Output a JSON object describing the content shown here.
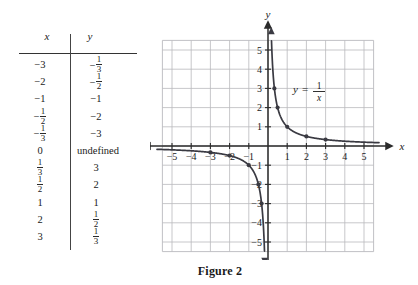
{
  "figure": {
    "caption": "Figure 2",
    "equation_label": "y = 1/x"
  },
  "table": {
    "name": "table-of-values",
    "headers": {
      "x": "x",
      "y": "y"
    },
    "rows": [
      {
        "x": "−3",
        "x_type": "plain",
        "y": "−1/3",
        "y_type": "neg-frac",
        "y_num": "1",
        "y_den": "3"
      },
      {
        "x": "−2",
        "x_type": "plain",
        "y": "−1/2",
        "y_type": "neg-frac",
        "y_num": "1",
        "y_den": "2"
      },
      {
        "x": "−1",
        "x_type": "plain",
        "y": "−1",
        "y_type": "plain"
      },
      {
        "x": "−1/2",
        "x_type": "neg-frac",
        "x_num": "1",
        "x_den": "2",
        "y": "−2",
        "y_type": "plain"
      },
      {
        "x": "−1/3",
        "x_type": "neg-frac",
        "x_num": "1",
        "x_den": "3",
        "y": "−3",
        "y_type": "plain"
      },
      {
        "x": "0",
        "x_type": "plain",
        "y": "undefined",
        "y_type": "wide"
      },
      {
        "x": "1/3",
        "x_type": "frac",
        "x_num": "1",
        "x_den": "3",
        "y": "3",
        "y_type": "plain"
      },
      {
        "x": "1/2",
        "x_type": "frac",
        "x_num": "1",
        "x_den": "2",
        "y": "2",
        "y_type": "plain"
      },
      {
        "x": "1",
        "x_type": "plain",
        "y": "1",
        "y_type": "plain"
      },
      {
        "x": "2",
        "x_type": "plain",
        "y": "1/2",
        "y_type": "frac",
        "y_num": "1",
        "y_den": "2"
      },
      {
        "x": "3",
        "x_type": "plain",
        "y": "1/3",
        "y_type": "frac",
        "y_num": "1",
        "y_den": "3"
      }
    ]
  },
  "chart_data": {
    "type": "line",
    "title": "",
    "equation": "y = 1/x",
    "equation_parts": {
      "lhs": "y",
      "eq": "=",
      "num": "1",
      "den": "x"
    },
    "xlabel": "x",
    "ylabel": "y",
    "xlim": [
      -5.8,
      5.8
    ],
    "ylim": [
      -5.8,
      5.8
    ],
    "grid": true,
    "grid_step": 1,
    "x_ticks": [
      "−5",
      "−4",
      "−3",
      "−2",
      "−1",
      "1",
      "2",
      "3",
      "4",
      "5"
    ],
    "x_tick_values": [
      -5,
      -4,
      -3,
      -2,
      -1,
      1,
      2,
      3,
      4,
      5
    ],
    "y_ticks": [
      "5",
      "4",
      "3",
      "2",
      "1",
      "−1",
      "−2",
      "−3",
      "−4",
      "−5"
    ],
    "y_tick_values": [
      5,
      4,
      3,
      2,
      1,
      -1,
      -2,
      -3,
      -4,
      -5
    ],
    "series": [
      {
        "name": "y = 1/x (negative branch)",
        "x": [
          -5.8,
          -5,
          -4,
          -3,
          -2,
          -1,
          -0.5,
          -0.3333,
          -0.2,
          -0.18
        ],
        "y": [
          -0.1724,
          -0.2,
          -0.25,
          -0.3333,
          -0.5,
          -1,
          -2,
          -3,
          -5,
          -5.55
        ]
      },
      {
        "name": "y = 1/x (positive branch)",
        "x": [
          0.18,
          0.2,
          0.3333,
          0.5,
          1,
          2,
          3,
          4,
          5,
          5.8
        ],
        "y": [
          5.55,
          5,
          3,
          2,
          1,
          0.5,
          0.3333,
          0.25,
          0.2,
          0.1724
        ]
      }
    ],
    "points": [
      {
        "x": -3,
        "y": -0.3333,
        "label": "(−3, −1/3)"
      },
      {
        "x": -2,
        "y": -0.5,
        "label": "(−2, −1/2)"
      },
      {
        "x": -1,
        "y": -1,
        "label": "(−1, −1)"
      },
      {
        "x": -0.5,
        "y": -2,
        "label": "(−1/2, −2)"
      },
      {
        "x": -0.3333,
        "y": -3,
        "label": "(−1/3, −3)"
      },
      {
        "x": 0.3333,
        "y": 3,
        "label": "(1/3, 3)"
      },
      {
        "x": 0.5,
        "y": 2,
        "label": "(1/2, 2)"
      },
      {
        "x": 1,
        "y": 1,
        "label": "(1, 1)"
      },
      {
        "x": 2,
        "y": 0.5,
        "label": "(2, 1/2)"
      },
      {
        "x": 3,
        "y": 0.3333,
        "label": "(3, 1/3)"
      }
    ]
  },
  "colors": {
    "grid": "#b9b9bd",
    "axis": "#2b2b2b",
    "curve": "#3a3a42",
    "text": "#1a1a1a",
    "background": "#ffffff"
  }
}
